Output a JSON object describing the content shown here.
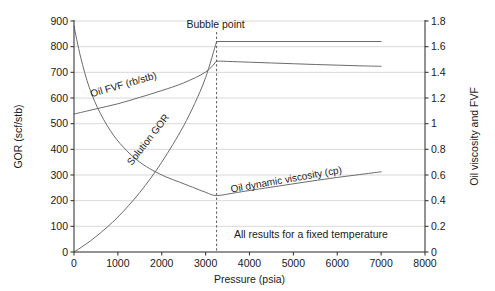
{
  "chart_data": {
    "type": "line",
    "title": "",
    "xlabel": "Pressure (psia)",
    "ylabel": "GOR (scf/stb)",
    "y2label": "Oil viscosity and FVF",
    "xlim": [
      0,
      8000
    ],
    "ylim": [
      0,
      900
    ],
    "y2lim": [
      0,
      1.8
    ],
    "xticks": [
      0,
      1000,
      2000,
      3000,
      4000,
      5000,
      6000,
      7000,
      8000
    ],
    "xtick_labels": [
      "0",
      "1000",
      "2000",
      "3000",
      "4000",
      "5000",
      "6000",
      "7000",
      "8000"
    ],
    "yticks": [
      0,
      100,
      200,
      300,
      400,
      500,
      600,
      700,
      800,
      900
    ],
    "ytick_labels": [
      "0",
      "100",
      "200",
      "300",
      "400",
      "500",
      "600",
      "700",
      "800",
      "900"
    ],
    "y2ticks": [
      0,
      0.2,
      0.4,
      0.6,
      0.8,
      1.0,
      1.2,
      1.4,
      1.6,
      1.8
    ],
    "y2tick_labels": [
      "0",
      "0.2",
      "0.4",
      "0.6",
      "0.8",
      "1",
      "1.2",
      "1.4",
      "1.6",
      "1.8"
    ],
    "grid": true,
    "legend_position": "inline-curve-labels",
    "annotations": [
      {
        "text": "Bubble point",
        "x": 3250,
        "y": 880,
        "kind": "bubble-point-marker"
      },
      {
        "text": "All results for a fixed temperature",
        "x": 5400,
        "y": 55,
        "kind": "footnote"
      }
    ],
    "bubble_point_pressure": 3250,
    "series": [
      {
        "name": "Solution GOR",
        "axis": "left",
        "units": "scf/stb",
        "label": "Solution GOR",
        "label_x": 1750,
        "label_y": 430,
        "label_rotation": -52,
        "x": [
          0,
          250,
          500,
          750,
          1000,
          1250,
          1500,
          1750,
          2000,
          2250,
          2500,
          2750,
          3000,
          3250,
          3500,
          4000,
          4500,
          5000,
          5500,
          6000,
          6500,
          7000
        ],
        "y": [
          0,
          28,
          60,
          96,
          136,
          182,
          232,
          288,
          350,
          418,
          492,
          578,
          680,
          820,
          820,
          820,
          820,
          820,
          820,
          820,
          820,
          820
        ]
      },
      {
        "name": "Oil FVF (rb/stb)",
        "axis": "right",
        "units": "rb/stb",
        "label": "Oil FVF (rb/stb)",
        "label_x": 1150,
        "label_y": 640,
        "label_rotation": -16,
        "x": [
          0,
          500,
          1000,
          1500,
          2000,
          2500,
          3000,
          3250,
          3500,
          4000,
          4500,
          5000,
          5500,
          6000,
          6500,
          7000
        ],
        "y_right": [
          1.075,
          1.115,
          1.155,
          1.205,
          1.258,
          1.318,
          1.402,
          1.488,
          1.485,
          1.479,
          1.473,
          1.467,
          1.461,
          1.456,
          1.451,
          1.447
        ]
      },
      {
        "name": "Oil dynamic viscosity (cp)",
        "axis": "right",
        "units": "cp",
        "label": "Oil dynamic viscosity (cp)",
        "label_x": 4850,
        "label_y": 270,
        "label_rotation": -10,
        "x": [
          0,
          150,
          350,
          600,
          900,
          1200,
          1500,
          1800,
          2100,
          2400,
          2700,
          3000,
          3250,
          3700,
          4200,
          4800,
          5400,
          6000,
          6500,
          7000
        ],
        "y_right": [
          1.76,
          1.52,
          1.28,
          1.08,
          0.91,
          0.79,
          0.7,
          0.635,
          0.585,
          0.545,
          0.505,
          0.465,
          0.44,
          0.463,
          0.49,
          0.521,
          0.552,
          0.581,
          0.603,
          0.625
        ]
      }
    ]
  },
  "axes": {
    "left_title": "GOR (scf/stb)",
    "right_title": "Oil viscosity and FVF",
    "bottom_title": "Pressure (psia)"
  },
  "labels": {
    "bubble_point": "Bubble point",
    "footnote": "All results for a fixed temperature",
    "solution_gor": "Solution GOR",
    "oil_fvf": "Oil FVF (rb/stb)",
    "oil_viscosity": "Oil dynamic viscosity (cp)"
  },
  "colors": {
    "curve": "#6b6b6b",
    "grid": "#c9c9c9",
    "axis": "#3a3a3a",
    "text": "#1a1a1a",
    "background": "#ffffff"
  }
}
